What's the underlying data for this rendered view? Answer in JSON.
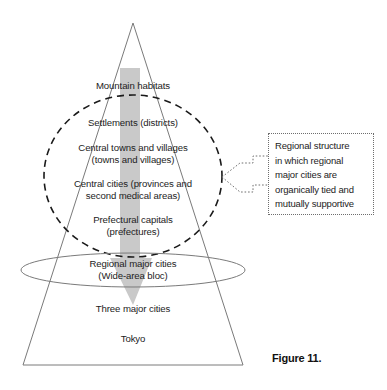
{
  "figure": {
    "caption": "Figure 11.",
    "type": "hierarchy-pyramid-diagram"
  },
  "hierarchy": {
    "levels": [
      {
        "id": "mountain-habitats",
        "lines": [
          "Mountain habitats"
        ]
      },
      {
        "id": "settlements",
        "lines": [
          "Settlements (districts)"
        ]
      },
      {
        "id": "central-towns-villages",
        "lines": [
          "Central towns and villages",
          "(towns and villages)"
        ]
      },
      {
        "id": "central-cities",
        "lines": [
          "Central cities (provinces and",
          "second medical areas)"
        ]
      },
      {
        "id": "prefectural-capitals",
        "lines": [
          "Prefectural capitals",
          "(prefectures)"
        ]
      },
      {
        "id": "regional-major-cities",
        "lines": [
          "Regional major cities",
          "(Wide-area bloc)"
        ]
      },
      {
        "id": "three-major-cities",
        "lines": [
          "Three major cities"
        ]
      },
      {
        "id": "tokyo",
        "lines": [
          "Tokyo"
        ]
      }
    ]
  },
  "callout": {
    "lines": [
      "Regional structure",
      "in which regional",
      "major cities are",
      "organically tied and",
      "mutually supportive"
    ]
  },
  "colors": {
    "stroke": "#6e6e6e",
    "dashed_stroke": "#1a1a1a",
    "arrow_fill": "#c9c9c9",
    "text": "#1c1c1c",
    "background": "#ffffff"
  }
}
